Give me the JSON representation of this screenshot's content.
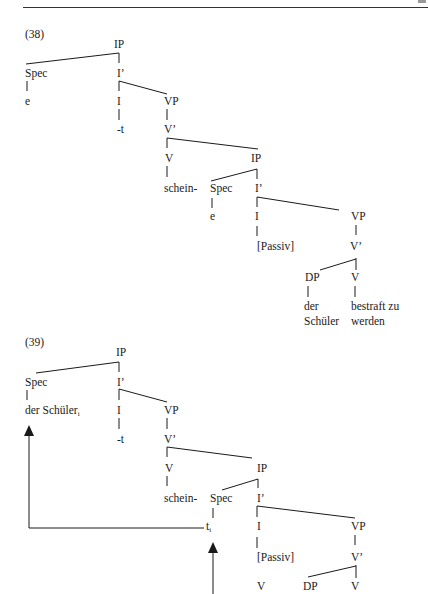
{
  "examples": [
    {
      "number": "(38)",
      "nodes": {
        "ip1": "IP",
        "spec1": "Spec",
        "e1": "e",
        "ibar1": "I’",
        "i1": "I",
        "t1": "-t",
        "vp1": "VP",
        "vbar1": "V’",
        "v1": "V",
        "schein": "schein-",
        "ip2": "IP",
        "spec2": "Spec",
        "e2": "e",
        "ibar2": "I’",
        "i2": "I",
        "passiv": "[Passiv]",
        "vp2": "VP",
        "vbar2": "V’",
        "dp": "DP",
        "v2": "V",
        "der": "der",
        "schueler": "Schüler",
        "bestraft": "bestraft zu",
        "werden": "werden"
      }
    },
    {
      "number": "(39)",
      "nodes": {
        "ip1": "IP",
        "spec1": "Spec",
        "derschueler": "der Schüler",
        "index_i": "i",
        "ibar1": "I’",
        "i1": "I",
        "t1": "-t",
        "vp1": "VP",
        "vbar1": "V’",
        "v1": "V",
        "schein": "schein-",
        "ip2": "IP",
        "spec2": "Spec",
        "trace": "t",
        "trace_index": "i",
        "ibar2": "I’",
        "i2": "I",
        "passiv": "[Passiv]",
        "vp2": "VP",
        "vbar2": "V’",
        "v3": "V",
        "dp": "DP",
        "v2": "V"
      }
    }
  ]
}
